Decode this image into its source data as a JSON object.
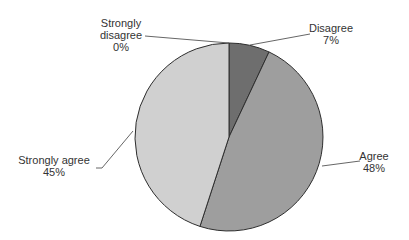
{
  "chart_data": {
    "type": "pie",
    "title": "",
    "categories": [
      "Disagree",
      "Agree",
      "Strongly agree",
      "Strongly disagree"
    ],
    "values": [
      7,
      48,
      45,
      0
    ],
    "unit": "%",
    "start_angle_deg": 0,
    "direction": "clockwise",
    "colors": [
      "#6e6e6e",
      "#9e9e9e",
      "#d0d0d0",
      "#bbbbbb"
    ],
    "labels": [
      {
        "name": "Strongly disagree",
        "name_lines": [
          "Strongly",
          "disagree"
        ],
        "pct": "0%"
      },
      {
        "name": "Disagree",
        "name_lines": [
          "Disagree"
        ],
        "pct": "7%"
      },
      {
        "name": "Agree",
        "name_lines": [
          "Agree"
        ],
        "pct": "48%"
      },
      {
        "name": "Strongly agree",
        "name_lines": [
          "Strongly agree"
        ],
        "pct": "45%"
      }
    ],
    "legend": "none (data labels with leader lines)"
  }
}
